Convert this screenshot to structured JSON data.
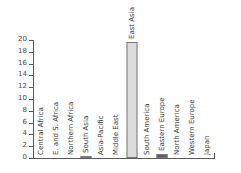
{
  "chart_data": {
    "type": "bar",
    "title": "",
    "subtitle": "",
    "xlabel": "",
    "ylabel": "",
    "ylim": [
      0,
      20
    ],
    "yticks": [
      0,
      2,
      4,
      6,
      8,
      10,
      12,
      14,
      16,
      18,
      20
    ],
    "grid": false,
    "legend": "none",
    "categories": [
      "Central Africa",
      "E. and S. Africa",
      "Northern Africa",
      "South Asia",
      "Asia-Pacific",
      "Middle East",
      "East Asia",
      "South America",
      "Eastern Europe",
      "North America",
      "Western Europe",
      "Japan"
    ],
    "values": [
      0,
      0,
      0,
      0.3,
      0,
      0,
      19.7,
      0,
      0.6,
      0,
      0,
      0
    ],
    "bar_colors": [
      "#d9d9d9",
      "#d9d9d9",
      "#d9d9d9",
      "#9a9a9a",
      "#d9d9d9",
      "#d9d9d9",
      "#dcdcdc",
      "#d9d9d9",
      "#5c5c5c",
      "#d9d9d9",
      "#d9d9d9",
      "#d9d9d9"
    ],
    "bar_border_color": "#7a7a7a",
    "axis_color": "#5a5a5a",
    "text_color": "#3a3a3a",
    "background": "#ffffff"
  }
}
